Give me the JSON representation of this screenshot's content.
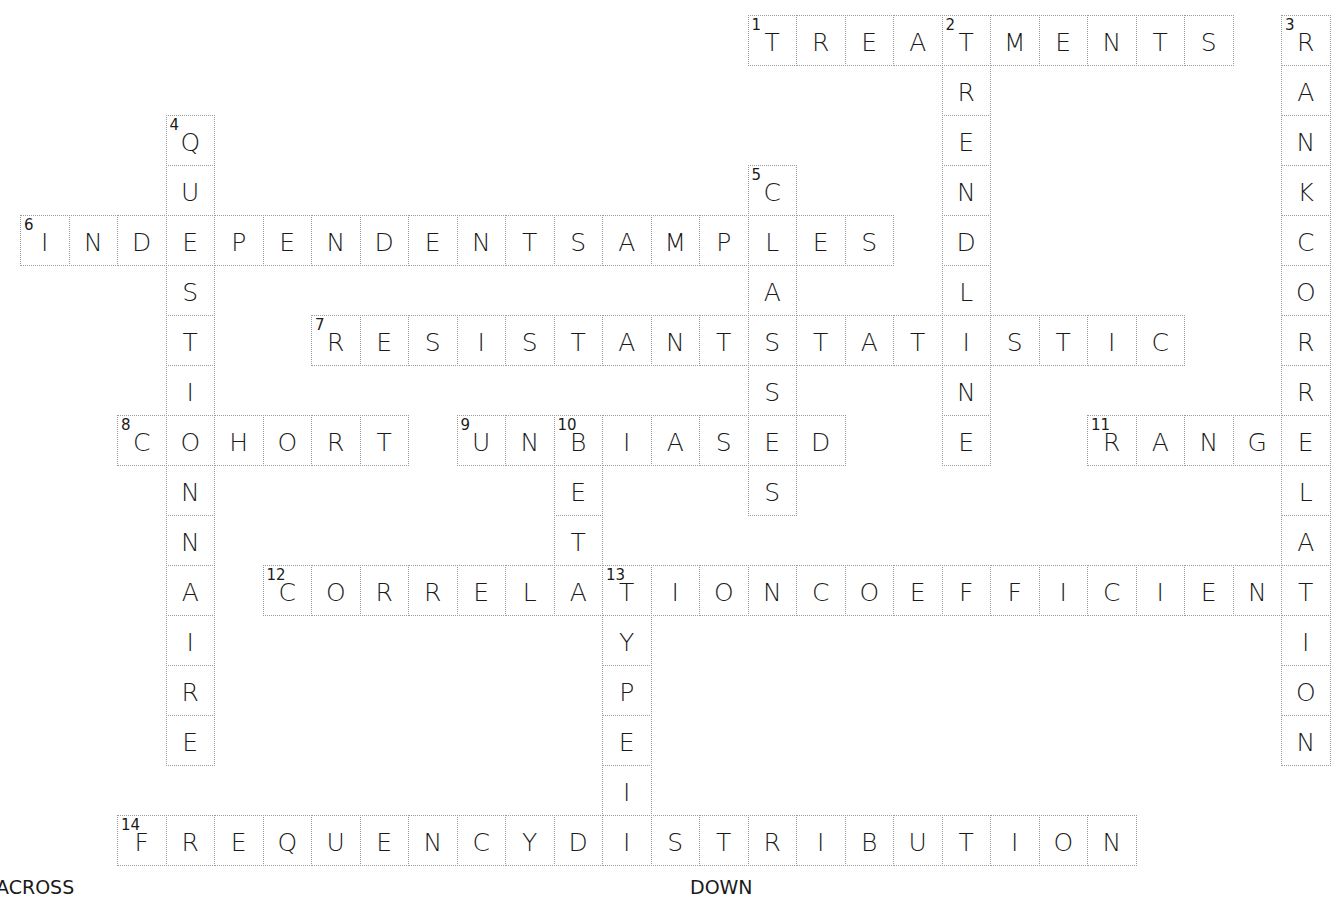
{
  "puzzle": {
    "grid": {
      "origin_x": 20,
      "origin_y": 15,
      "cell_w": 48.5,
      "cell_h": 50,
      "border_color": "#9a9a9a"
    },
    "words": [
      {
        "number": 1,
        "answer": "TREATMENTS",
        "direction": "across",
        "row": 0,
        "col": 15
      },
      {
        "number": 2,
        "answer": "TRENDLINE",
        "direction": "down",
        "row": 0,
        "col": 19
      },
      {
        "number": 3,
        "answer": "RANKCORRELATION",
        "direction": "down",
        "row": 0,
        "col": 26
      },
      {
        "number": 4,
        "answer": "QUESTIONNAIRE",
        "direction": "down",
        "row": 2,
        "col": 3
      },
      {
        "number": 5,
        "answer": "CLASSES",
        "direction": "down",
        "row": 3,
        "col": 15
      },
      {
        "number": 6,
        "answer": "INDEPENDENTSAMPLES",
        "direction": "across",
        "row": 4,
        "col": 0
      },
      {
        "number": 7,
        "answer": "RESISTANTSTATISTIC",
        "direction": "across",
        "row": 6,
        "col": 6
      },
      {
        "number": 8,
        "answer": "COHORT",
        "direction": "across",
        "row": 8,
        "col": 2
      },
      {
        "number": 9,
        "answer": "UNBIASED",
        "direction": "across",
        "row": 8,
        "col": 9
      },
      {
        "number": 10,
        "answer": "BETA",
        "direction": "down",
        "row": 8,
        "col": 11
      },
      {
        "number": 11,
        "answer": "RANGE",
        "direction": "across",
        "row": 8,
        "col": 22
      },
      {
        "number": 12,
        "answer": "CORRELATIONCOEFFICIENT",
        "direction": "across",
        "row": 11,
        "col": 5
      },
      {
        "number": 13,
        "answer": "TYPEI",
        "direction": "down",
        "row": 11,
        "col": 12
      },
      {
        "number": 14,
        "answer": "FREQUENCYDISTRIBUTION",
        "direction": "across",
        "row": 16,
        "col": 2
      }
    ]
  },
  "headings": {
    "across": "ACROSS",
    "down": "DOWN"
  }
}
